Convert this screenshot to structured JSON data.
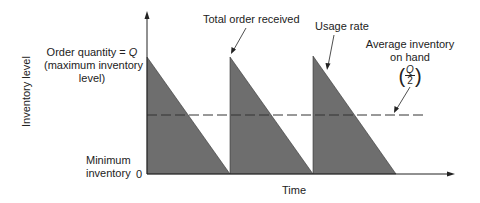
{
  "diagram": {
    "type": "inventory-sawtooth",
    "y_axis_label": "Inventory level",
    "x_axis_label": "Time",
    "y_ticks": {
      "zero": "0"
    },
    "labels": {
      "order_quantity_line1_prefix": "Order quantity = ",
      "order_quantity_symbol": "Q",
      "order_quantity_line2": "(maximum inventory",
      "order_quantity_line3": "level)",
      "minimum_inventory_line1": "Minimum",
      "minimum_inventory_line2": "inventory",
      "total_order_received": "Total order received",
      "usage_rate": "Usage rate",
      "average_inventory_line1": "Average inventory",
      "average_inventory_line2": "on hand",
      "average_formula_numerator": "Q",
      "average_formula_denominator": "2"
    },
    "colors": {
      "fill": "#6e6e6e",
      "line": "#222222",
      "dashed": "#333333"
    },
    "cycles": 3
  }
}
